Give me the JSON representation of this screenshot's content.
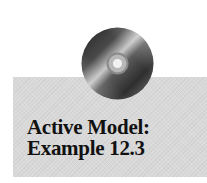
{
  "panel": {
    "background_color": "#d9d9d9"
  },
  "icon": {
    "name": "cd-disc-icon"
  },
  "title": {
    "line1": "Active Model:",
    "line2": "Example 12.3",
    "color": "#111111"
  }
}
